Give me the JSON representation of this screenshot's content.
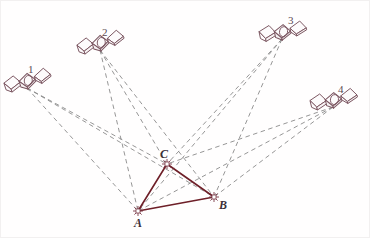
{
  "figure": {
    "background_color": "#ffffff",
    "border_color": "#f2f0f0",
    "satellite_color": "#7a5560",
    "link_color": "#8a8a8a",
    "triangle_color": "#6e1f28",
    "marker_color": "#7a3a48"
  },
  "satellites": [
    {
      "id": "sat-1",
      "label": "1",
      "x": 26,
      "y": 82,
      "label_x": 27,
      "label_y": 63,
      "rotation": -18
    },
    {
      "id": "sat-2",
      "label": "2",
      "x": 99,
      "y": 44,
      "label_x": 101,
      "label_y": 26,
      "rotation": -18
    },
    {
      "id": "sat-3",
      "label": "3",
      "x": 281,
      "y": 33,
      "label_x": 287,
      "label_y": 14,
      "rotation": -12
    },
    {
      "id": "sat-4",
      "label": "4",
      "x": 332,
      "y": 101,
      "label_x": 337,
      "label_y": 83,
      "rotation": -14
    }
  ],
  "ground_points": [
    {
      "id": "point-a",
      "label": "A",
      "x": 137,
      "y": 210,
      "label_x": 133,
      "label_y": 216
    },
    {
      "id": "point-b",
      "label": "B",
      "x": 213,
      "y": 196,
      "label_x": 218,
      "label_y": 198
    },
    {
      "id": "point-c",
      "label": "C",
      "x": 166,
      "y": 163,
      "label_x": 159,
      "label_y": 147
    }
  ],
  "triangle_edges": [
    {
      "id": "edge-ca",
      "from": "C",
      "to": "A"
    },
    {
      "id": "edge-ab",
      "from": "A",
      "to": "B"
    },
    {
      "id": "edge-bc",
      "from": "B",
      "to": "C"
    }
  ],
  "observation_links": [
    {
      "id": "link-1-a",
      "from": "1",
      "to": "A"
    },
    {
      "id": "link-1-b",
      "from": "1",
      "to": "B"
    },
    {
      "id": "link-1-c",
      "from": "1",
      "to": "C"
    },
    {
      "id": "link-2-a",
      "from": "2",
      "to": "A"
    },
    {
      "id": "link-2-b",
      "from": "2",
      "to": "B"
    },
    {
      "id": "link-2-c",
      "from": "2",
      "to": "C"
    },
    {
      "id": "link-3-a",
      "from": "3",
      "to": "A"
    },
    {
      "id": "link-3-b",
      "from": "3",
      "to": "B"
    },
    {
      "id": "link-3-c",
      "from": "3",
      "to": "C"
    },
    {
      "id": "link-4-a",
      "from": "4",
      "to": "A"
    },
    {
      "id": "link-4-b",
      "from": "4",
      "to": "B"
    },
    {
      "id": "link-4-c",
      "from": "4",
      "to": "C"
    }
  ]
}
